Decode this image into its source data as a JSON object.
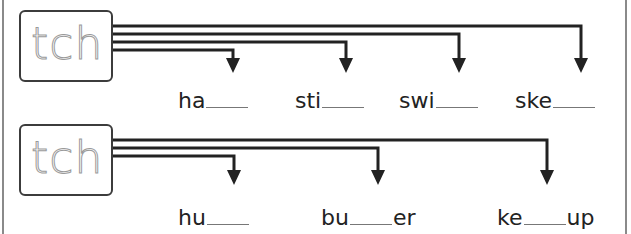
{
  "worksheet": {
    "digraph": "tch",
    "rows": [
      {
        "letters": "tch",
        "words": [
          {
            "prefix": "ha",
            "suffix": ""
          },
          {
            "prefix": "sti",
            "suffix": ""
          },
          {
            "prefix": "swi",
            "suffix": ""
          },
          {
            "prefix": "ske",
            "suffix": ""
          }
        ]
      },
      {
        "letters": "tch",
        "words": [
          {
            "prefix": "hu",
            "suffix": ""
          },
          {
            "prefix": "bu",
            "suffix": "er"
          },
          {
            "prefix": "ke",
            "suffix": "up"
          }
        ]
      }
    ]
  },
  "colors": {
    "line": "#222222",
    "frame": "#8a8a8a",
    "trace": "#9a9a9a",
    "blank": "#777777"
  }
}
